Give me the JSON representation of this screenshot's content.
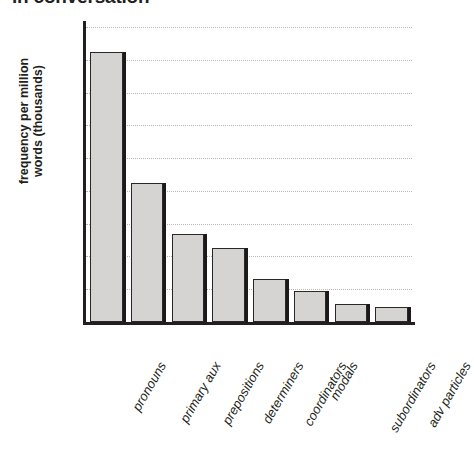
{
  "chart_data": {
    "type": "bar",
    "title": "in conversation",
    "subtitle": "",
    "xlabel": "",
    "ylabel": "frequency per million words (thousands)",
    "ylabel_lines": [
      "frequency per million",
      "words (thousands)"
    ],
    "categories": [
      "pronouns",
      "primary aux",
      "prepositions",
      "determiners",
      "coordinators",
      "modals",
      "subordinators",
      "adv particles"
    ],
    "values": [
      165,
      85,
      54,
      45,
      26,
      19,
      11,
      9
    ],
    "ylim": [
      0,
      180
    ],
    "yticks": [
      0,
      20,
      40,
      60,
      80,
      100,
      120,
      140,
      160,
      180
    ],
    "ytick_labels": [
      "0",
      "20",
      "40",
      "60",
      "80",
      "100",
      "120",
      "140",
      "160",
      "180"
    ],
    "grid": true,
    "grid_style": "dotted",
    "legend": false,
    "legend_position": "none",
    "colors": {
      "bar_fill": "#d5d4d3",
      "bar_border": "#2a2727",
      "bar_shadow": "#1b1919",
      "axis": "#231f20",
      "grid": "#b9b9b9",
      "text": "#231f20",
      "background": "#ffffff"
    }
  }
}
